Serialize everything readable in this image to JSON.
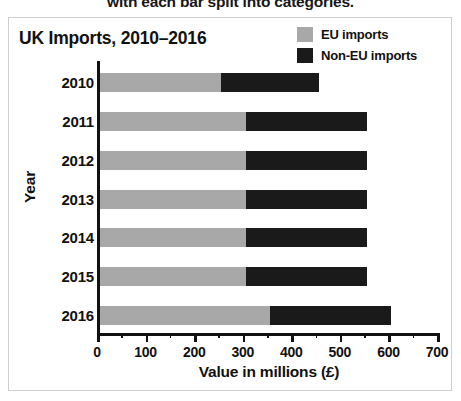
{
  "caption": {
    "text": "with each bar split into categories."
  },
  "chart_data": {
    "type": "bar",
    "orientation": "horizontal",
    "stacked": true,
    "title": "UK Imports, 2010–2016",
    "xlabel": "Value in millions (£)",
    "ylabel": "Year",
    "categories": [
      "2010",
      "2011",
      "2012",
      "2013",
      "2014",
      "2015",
      "2016"
    ],
    "series": [
      {
        "name": "EU imports",
        "color": "#a8a8a8",
        "values": [
          250,
          300,
          300,
          300,
          300,
          300,
          350
        ]
      },
      {
        "name": "Non-EU imports",
        "color": "#1a1a1a",
        "values": [
          200,
          250,
          250,
          250,
          250,
          250,
          250
        ]
      }
    ],
    "totals": [
      450,
      550,
      550,
      550,
      550,
      550,
      600
    ],
    "xlim": [
      0,
      700
    ],
    "xticks": [
      0,
      100,
      200,
      300,
      400,
      500,
      600,
      700
    ],
    "xtick_labels": [
      "0",
      "100",
      "200",
      "300",
      "400",
      "500",
      "600",
      "700"
    ],
    "xminor_step": 50,
    "grid": false,
    "legend_position": "top-right",
    "legend": [
      "EU imports",
      "Non-EU imports"
    ]
  }
}
